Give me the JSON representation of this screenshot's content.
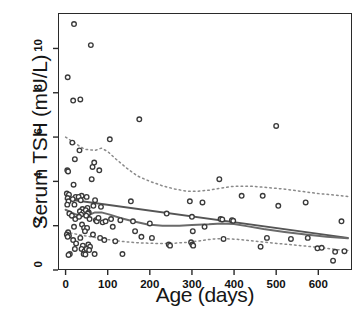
{
  "chart_data": {
    "type": "scatter",
    "title": "",
    "xlabel": "Age (days)",
    "ylabel": "Serum TSH (mU/L)",
    "xlim": [
      -18,
      680
    ],
    "ylim": [
      0,
      11.6
    ],
    "xticks": [
      0,
      100,
      200,
      300,
      400,
      500,
      600
    ],
    "yticks": [
      0,
      2,
      4,
      6,
      8,
      10
    ],
    "xticklabels": [
      "0",
      "100",
      "200",
      "300",
      "400",
      "500",
      "600"
    ],
    "yticklabels": [
      "0",
      "2",
      "4",
      "6",
      "8",
      "10"
    ],
    "grid": false,
    "legend": "none",
    "marker": "open-circle",
    "marker_color": "#3a3a3a",
    "line_color": "#4a4a4a",
    "points": [
      [
        5,
        8.7
      ],
      [
        4,
        4.5
      ],
      [
        6,
        4.45
      ],
      [
        3,
        3.45
      ],
      [
        8,
        3.4
      ],
      [
        5,
        3.25
      ],
      [
        7,
        3.1
      ],
      [
        4,
        2.95
      ],
      [
        9,
        2.55
      ],
      [
        6,
        1.7
      ],
      [
        3,
        1.6
      ],
      [
        8,
        1.55
      ],
      [
        5,
        1.5
      ],
      [
        10,
        0.72
      ],
      [
        7,
        0.68
      ],
      [
        18,
        7.65
      ],
      [
        20,
        11.1
      ],
      [
        16,
        5.75
      ],
      [
        22,
        5.0
      ],
      [
        19,
        3.85
      ],
      [
        24,
        3.3
      ],
      [
        17,
        3.2
      ],
      [
        21,
        2.95
      ],
      [
        15,
        2.45
      ],
      [
        23,
        2.3
      ],
      [
        20,
        1.95
      ],
      [
        18,
        1.35
      ],
      [
        25,
        1.2
      ],
      [
        22,
        0.95
      ],
      [
        35,
        7.7
      ],
      [
        33,
        5.4
      ],
      [
        38,
        3.35
      ],
      [
        31,
        3.3
      ],
      [
        36,
        3.15
      ],
      [
        40,
        2.75
      ],
      [
        34,
        2.65
      ],
      [
        42,
        2.6
      ],
      [
        37,
        2.5
      ],
      [
        32,
        2.4
      ],
      [
        39,
        2.05
      ],
      [
        44,
        1.9
      ],
      [
        35,
        1.45
      ],
      [
        41,
        1.1
      ],
      [
        38,
        0.95
      ],
      [
        45,
        0.85
      ],
      [
        43,
        0.72
      ],
      [
        50,
        3.3
      ],
      [
        52,
        2.8
      ],
      [
        48,
        2.7
      ],
      [
        55,
        2.6
      ],
      [
        53,
        2.55
      ],
      [
        49,
        2.45
      ],
      [
        57,
        2.3
      ],
      [
        51,
        1.9
      ],
      [
        46,
        1.75
      ],
      [
        54,
        1.15
      ],
      [
        58,
        1.05
      ],
      [
        50,
        0.95
      ],
      [
        56,
        0.9
      ],
      [
        47,
        0.7
      ],
      [
        60,
        10.15
      ],
      [
        64,
        4.65
      ],
      [
        68,
        4.85
      ],
      [
        62,
        4.1
      ],
      [
        70,
        3.15
      ],
      [
        66,
        2.9
      ],
      [
        72,
        2.25
      ],
      [
        74,
        2.2
      ],
      [
        65,
        1.6
      ],
      [
        69,
        0.72
      ],
      [
        80,
        4.5
      ],
      [
        84,
        2.85
      ],
      [
        78,
        2.35
      ],
      [
        88,
        2.15
      ],
      [
        82,
        1.45
      ],
      [
        95,
        2.2
      ],
      [
        92,
        1.35
      ],
      [
        105,
        5.9
      ],
      [
        108,
        2.3
      ],
      [
        112,
        1.95
      ],
      [
        118,
        1.3
      ],
      [
        130,
        2.25
      ],
      [
        135,
        0.72
      ],
      [
        155,
        3.1
      ],
      [
        160,
        2.2
      ],
      [
        165,
        1.75
      ],
      [
        175,
        6.8
      ],
      [
        180,
        1.5
      ],
      [
        200,
        2.1
      ],
      [
        205,
        1.45
      ],
      [
        240,
        2.55
      ],
      [
        245,
        1.15
      ],
      [
        248,
        1.1
      ],
      [
        295,
        3.1
      ],
      [
        300,
        2.4
      ],
      [
        302,
        1.75
      ],
      [
        298,
        1.25
      ],
      [
        301,
        1.15
      ],
      [
        303,
        1.1
      ],
      [
        325,
        3.05
      ],
      [
        330,
        1.95
      ],
      [
        365,
        4.1
      ],
      [
        368,
        2.3
      ],
      [
        372,
        2.28
      ],
      [
        375,
        1.4
      ],
      [
        395,
        2.25
      ],
      [
        398,
        2.22
      ],
      [
        418,
        3.35
      ],
      [
        463,
        1.05
      ],
      [
        468,
        3.35
      ],
      [
        478,
        1.45
      ],
      [
        500,
        6.5
      ],
      [
        505,
        2.9
      ],
      [
        535,
        1.4
      ],
      [
        570,
        3.05
      ],
      [
        575,
        1.45
      ],
      [
        598,
        0.98
      ],
      [
        608,
        1.0
      ],
      [
        635,
        0.42
      ],
      [
        640,
        0.82
      ],
      [
        655,
        2.2
      ],
      [
        662,
        0.85
      ]
    ],
    "series": [
      {
        "name": "linear-regression-line",
        "style": "solid",
        "color": "#555555",
        "points": [
          [
            0,
            3.2
          ],
          [
            670,
            1.45
          ]
        ]
      },
      {
        "name": "loess-smooth-line",
        "style": "solid",
        "color": "#6a6a6a",
        "points": [
          [
            0,
            2.72
          ],
          [
            25,
            2.5
          ],
          [
            50,
            2.45
          ],
          [
            70,
            2.6
          ],
          [
            85,
            2.6
          ],
          [
            105,
            2.5
          ],
          [
            130,
            2.35
          ],
          [
            160,
            2.2
          ],
          [
            195,
            2.05
          ],
          [
            230,
            2.0
          ],
          [
            270,
            2.0
          ],
          [
            300,
            2.03
          ],
          [
            340,
            2.06
          ],
          [
            370,
            2.1
          ],
          [
            400,
            2.08
          ],
          [
            430,
            1.98
          ],
          [
            470,
            1.85
          ],
          [
            520,
            1.72
          ],
          [
            570,
            1.6
          ],
          [
            620,
            1.5
          ],
          [
            670,
            1.43
          ]
        ]
      },
      {
        "name": "upper-reference-band",
        "style": "dashed",
        "color": "#8a8a8a",
        "points": [
          [
            0,
            6.0
          ],
          [
            20,
            5.75
          ],
          [
            45,
            5.45
          ],
          [
            70,
            5.4
          ],
          [
            85,
            5.5
          ],
          [
            100,
            5.35
          ],
          [
            120,
            5.0
          ],
          [
            145,
            4.6
          ],
          [
            170,
            4.25
          ],
          [
            200,
            4.0
          ],
          [
            230,
            3.8
          ],
          [
            260,
            3.65
          ],
          [
            290,
            3.55
          ],
          [
            310,
            3.55
          ],
          [
            340,
            3.6
          ],
          [
            370,
            3.7
          ],
          [
            400,
            3.78
          ],
          [
            440,
            3.78
          ],
          [
            480,
            3.72
          ],
          [
            520,
            3.65
          ],
          [
            560,
            3.55
          ],
          [
            600,
            3.45
          ],
          [
            640,
            3.38
          ],
          [
            670,
            3.32
          ]
        ]
      },
      {
        "name": "lower-reference-band",
        "style": "dashed",
        "color": "#8a8a8a",
        "points": [
          [
            0,
            1.72
          ],
          [
            30,
            1.6
          ],
          [
            60,
            1.5
          ],
          [
            90,
            1.4
          ],
          [
            120,
            1.32
          ],
          [
            150,
            1.26
          ],
          [
            180,
            1.22
          ],
          [
            215,
            1.2
          ],
          [
            250,
            1.2
          ],
          [
            290,
            1.25
          ],
          [
            320,
            1.32
          ],
          [
            350,
            1.4
          ],
          [
            375,
            1.42
          ],
          [
            410,
            1.38
          ],
          [
            450,
            1.3
          ],
          [
            490,
            1.22
          ],
          [
            530,
            1.15
          ],
          [
            570,
            1.08
          ],
          [
            610,
            1.0
          ],
          [
            645,
            0.92
          ],
          [
            670,
            0.88
          ]
        ]
      }
    ]
  },
  "caption": {
    "text": ""
  }
}
